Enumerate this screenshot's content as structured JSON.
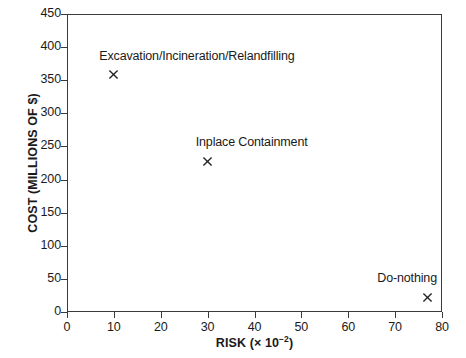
{
  "chart_data": {
    "type": "scatter",
    "title": "",
    "xlabel": "RISK (x 10-2)",
    "xlabel_text": "RISK (× 10",
    "xlabel_sup": "−2",
    "xlabel_tail": ")",
    "ylabel": "COST (MILLIONS OF $)",
    "xlim": [
      0,
      80
    ],
    "ylim": [
      0,
      450
    ],
    "xticks": [
      0,
      10,
      20,
      30,
      40,
      50,
      60,
      70,
      80
    ],
    "yticks": [
      0,
      50,
      100,
      150,
      200,
      250,
      300,
      350,
      400,
      450
    ],
    "xtick_labels": [
      "0",
      "10",
      "20",
      "30",
      "40",
      "50",
      "60",
      "70",
      "80"
    ],
    "ytick_labels": [
      "0",
      "50",
      "100",
      "150",
      "200",
      "250",
      "300",
      "350",
      "400",
      "450"
    ],
    "grid": false,
    "legend": "none",
    "marker": "x",
    "marker_color": "#222222",
    "frame_color": "#3a3a3a",
    "background": "#ffffff",
    "points": [
      {
        "label": "Excavation/Incineration/Relandfilling",
        "x": 10,
        "y": 358,
        "label_anchor": "center",
        "label_dx": 83,
        "label_dy": -26
      },
      {
        "label": "Inplace Containment",
        "x": 30,
        "y": 228,
        "label_anchor": "center",
        "label_dx": 44,
        "label_dy": -26
      },
      {
        "label": "Do-nothing",
        "x": 77,
        "y": 22,
        "label_anchor": "right",
        "label_dx": 9,
        "label_dy": -26
      }
    ]
  }
}
